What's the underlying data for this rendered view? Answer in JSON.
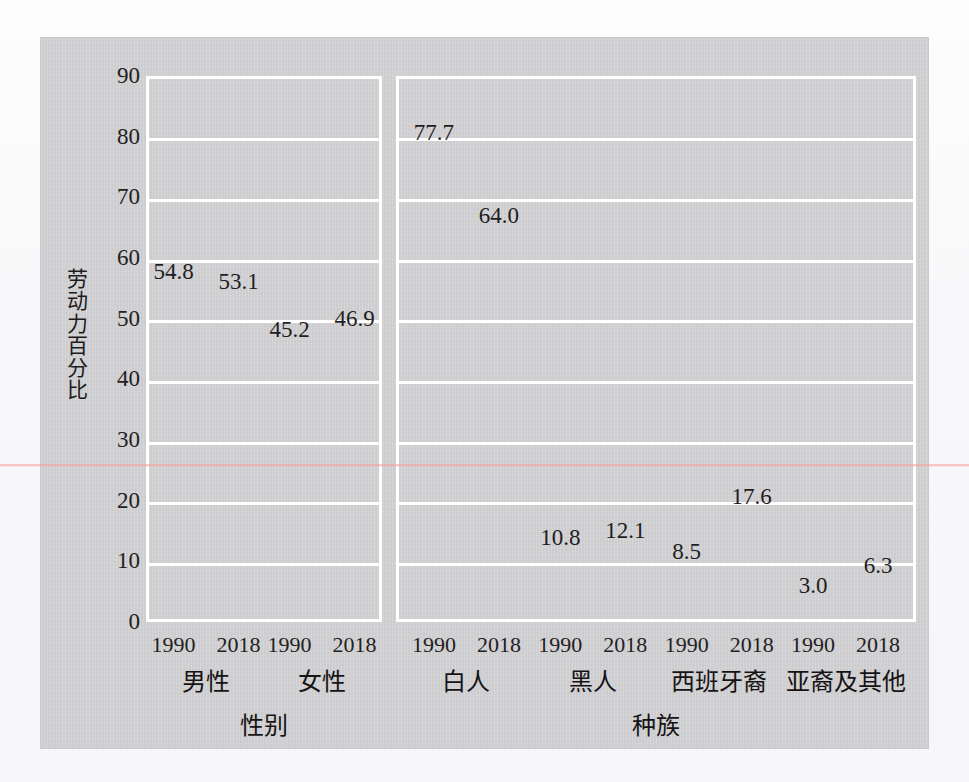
{
  "chart_data": {
    "type": "bar",
    "title": "",
    "xlabel": "",
    "ylabel": "劳动力百分比",
    "ylim": [
      0,
      90
    ],
    "ytick_step": 10,
    "yticks": [
      "90",
      "80",
      "70",
      "60",
      "50",
      "40",
      "30",
      "20",
      "10",
      "0"
    ],
    "grid": true,
    "legend_position": "none",
    "series": [
      {
        "name": "1990",
        "color": "#6da7a6"
      },
      {
        "name": "2018",
        "color": "#f2912e"
      }
    ],
    "panels": [
      {
        "group_label": "性别",
        "categories": [
          "男性",
          "女性"
        ],
        "bars": [
          {
            "category": "男性",
            "series": "1990",
            "year": "1990",
            "value": 54.8,
            "label": "54.8"
          },
          {
            "category": "男性",
            "series": "2018",
            "year": "2018",
            "value": 53.1,
            "label": "53.1"
          },
          {
            "category": "女性",
            "series": "1990",
            "year": "1990",
            "value": 45.2,
            "label": "45.2"
          },
          {
            "category": "女性",
            "series": "2018",
            "year": "2018",
            "value": 46.9,
            "label": "46.9"
          }
        ]
      },
      {
        "group_label": "种族",
        "categories": [
          "白人",
          "黑人",
          "西班牙裔",
          "亚裔及其他"
        ],
        "bars": [
          {
            "category": "白人",
            "series": "1990",
            "year": "1990",
            "value": 77.7,
            "label": "77.7"
          },
          {
            "category": "白人",
            "series": "2018",
            "year": "2018",
            "value": 64.0,
            "label": "64.0"
          },
          {
            "category": "黑人",
            "series": "1990",
            "year": "1990",
            "value": 10.8,
            "label": "10.8"
          },
          {
            "category": "黑人",
            "series": "2018",
            "year": "2018",
            "value": 12.1,
            "label": "12.1"
          },
          {
            "category": "西班牙裔",
            "series": "1990",
            "year": "1990",
            "value": 8.5,
            "label": "8.5"
          },
          {
            "category": "西班牙裔",
            "series": "2018",
            "year": "2018",
            "value": 17.6,
            "label": "17.6"
          },
          {
            "category": "亚裔及其他",
            "series": "1990",
            "year": "1990",
            "value": 3.0,
            "label": "3.0"
          },
          {
            "category": "亚裔及其他",
            "series": "2018",
            "year": "2018",
            "value": 6.3,
            "label": "6.3"
          }
        ]
      }
    ]
  },
  "colors": {
    "series_1990": "#6da7a6",
    "series_2018": "#f2912e",
    "panel_background": "#cdcccf",
    "gridline": "#ffffff",
    "text": "#1f1d1e"
  }
}
